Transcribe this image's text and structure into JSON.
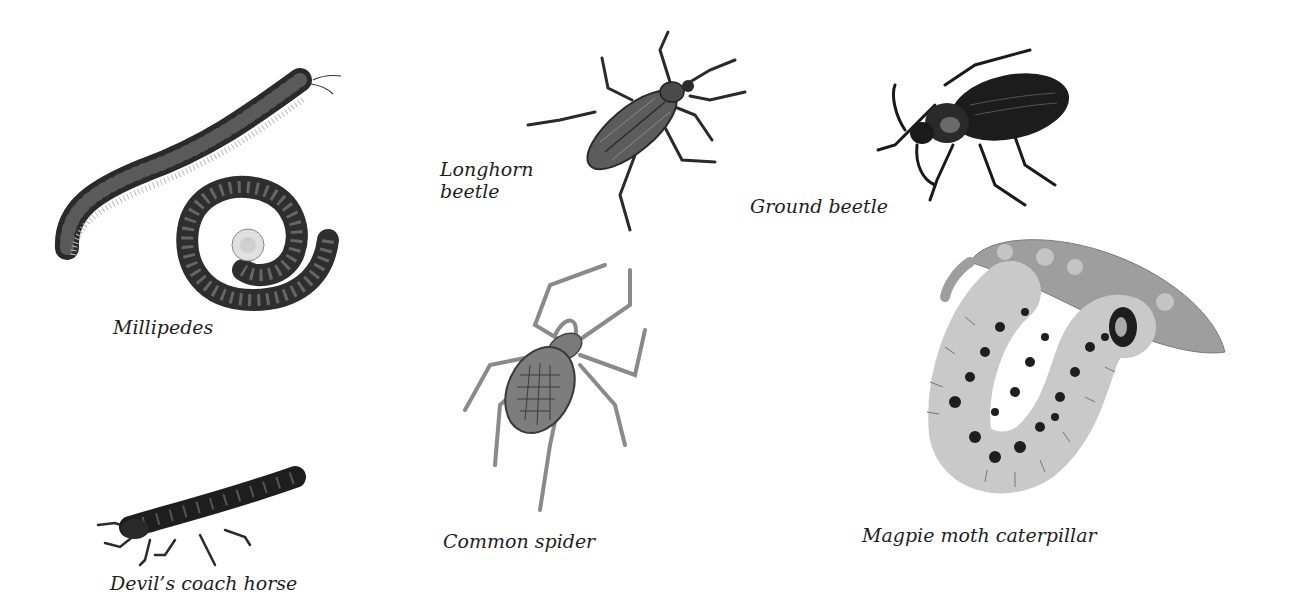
{
  "plate": {
    "background": "#ffffff",
    "ink": "#1e1e1e",
    "specimens": [
      {
        "id": "millipedes",
        "label": "Millipedes",
        "icon": "millipede-illustration"
      },
      {
        "id": "longhorn-beetle",
        "label_line1": "Longhorn",
        "label_line2": "beetle",
        "icon": "longhorn-beetle-illustration"
      },
      {
        "id": "ground-beetle",
        "label": "Ground beetle",
        "icon": "ground-beetle-illustration"
      },
      {
        "id": "devils-coach-horse",
        "label": "Devil’s coach horse",
        "icon": "devils-coach-horse-illustration"
      },
      {
        "id": "common-spider",
        "label": "Common spider",
        "icon": "spider-illustration"
      },
      {
        "id": "magpie-moth-caterpillar",
        "label": "Magpie moth caterpillar",
        "icon": "caterpillar-illustration"
      }
    ]
  }
}
